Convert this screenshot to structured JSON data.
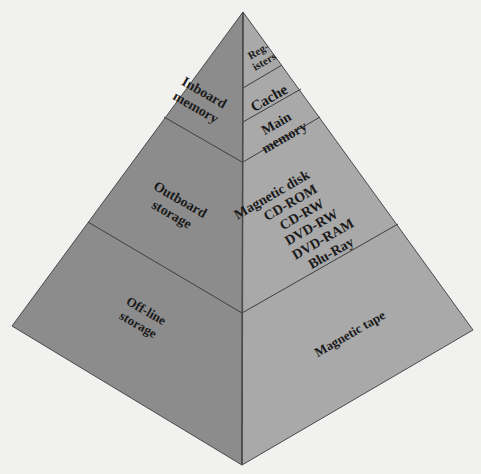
{
  "diagram": {
    "colors": {
      "background": "#f1f1f0",
      "left_face": "#8c8c8c",
      "right_face": "#a9a9a9",
      "edge": "#4a4a4a",
      "text": "#1a1a1a"
    },
    "left_face": {
      "levels": [
        {
          "id": "inboard",
          "line1": "Inboard",
          "line2": "memory"
        },
        {
          "id": "outboard",
          "line1": "Outboard",
          "line2": "storage"
        },
        {
          "id": "offline",
          "line1": "Off-line",
          "line2": "storage"
        }
      ]
    },
    "right_face": {
      "levels": [
        {
          "id": "registers",
          "line1": "Reg-",
          "line2": "isters"
        },
        {
          "id": "cache",
          "line1": "Cache"
        },
        {
          "id": "main",
          "line1": "Main",
          "line2": "memory"
        },
        {
          "id": "secondary",
          "lines": [
            "Magnetic disk",
            "CD-ROM",
            "CD-RW",
            "DVD-RW",
            "DVD-RAM",
            "Blu-Ray"
          ]
        },
        {
          "id": "tape",
          "line1": "Magnetic tape"
        }
      ]
    }
  }
}
